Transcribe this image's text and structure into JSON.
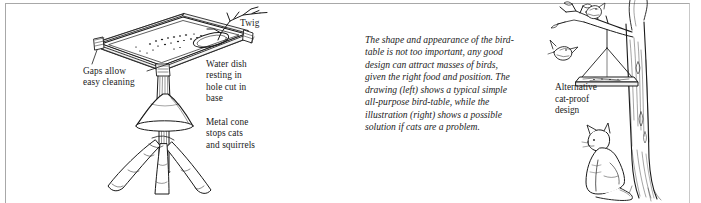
{
  "figure": {
    "frame_color": "#a8a8a8",
    "ink_color": "#1a1a1a",
    "background": "#ffffff"
  },
  "left_diagram": {
    "name": "pedestal-bird-table",
    "labels": {
      "twig": "Twig",
      "gaps": "Gaps allow\neasy cleaning",
      "water_dish": "Water dish\nresting in\nhole cut in\nbase",
      "metal_cone": "Metal cone\nstops cats\nand squirrels"
    },
    "parts": [
      "table-top-platform",
      "side-rails",
      "scattered-seed",
      "water-dish-hole",
      "corner-post",
      "twig-perch",
      "metal-cone",
      "central-post",
      "splayed-tripod-legs"
    ]
  },
  "body_copy": {
    "text": "The shape and appearance of the bird-table is not too important, any good design can attract masses of birds, given the right food and position. The drawing (left) shows a typical simple all-purpose bird-table, while the illustration (right) shows a possible solution if cats are a problem."
  },
  "right_diagram": {
    "name": "hanging-cat-proof-bird-table",
    "labels": {
      "caption": "Alternative\ncat-proof\ndesign"
    },
    "parts": [
      "tree-trunk",
      "overhanging-branch",
      "suspension-wires",
      "hanging-platform",
      "flying-bird",
      "perched-bird",
      "sitting-cat"
    ]
  }
}
